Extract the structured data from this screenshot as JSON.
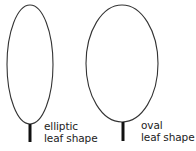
{
  "diagram": {
    "leaves": [
      {
        "name": "elliptic",
        "label_lines": [
          "elliptic",
          "leaf shape"
        ],
        "shape": {
          "cx": 30,
          "cy": 64.5,
          "rx": 23,
          "ry": 59.5
        },
        "stem": {
          "x": 30,
          "y1": 124,
          "y2": 142
        }
      },
      {
        "name": "oval",
        "label_lines": [
          "oval",
          "leaf shape"
        ],
        "shape": {
          "cx": 122,
          "cy": 63.5,
          "rx": 36,
          "ry": 58.5
        },
        "stem": {
          "x": 123,
          "y1": 122,
          "y2": 141
        }
      }
    ],
    "colors": {
      "outline": "#333333",
      "stem": "#111111",
      "text": "#222222",
      "background": "#ffffff"
    }
  }
}
